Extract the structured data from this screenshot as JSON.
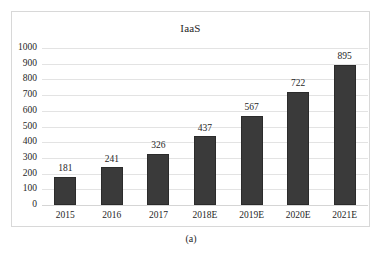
{
  "figure": {
    "caption": "(a)"
  },
  "chart_data": {
    "type": "bar",
    "title": "IaaS",
    "xlabel": "",
    "ylabel": "",
    "categories": [
      "2015",
      "2016",
      "2017",
      "2018E",
      "2019E",
      "2020E",
      "2021E"
    ],
    "values": [
      181,
      241,
      326,
      437,
      567,
      722,
      895
    ],
    "data_labels": [
      "181",
      "241",
      "326",
      "437",
      "567",
      "722",
      "895"
    ],
    "ylim": [
      0,
      1000
    ],
    "ytick_step": 100,
    "ytick_labels": [
      "1000",
      "900",
      "800",
      "700",
      "600",
      "500",
      "400",
      "300",
      "200",
      "100",
      "0"
    ],
    "ytick_values": [
      1000,
      900,
      800,
      700,
      600,
      500,
      400,
      300,
      200,
      100,
      0
    ],
    "grid": true,
    "legend": false,
    "legend_position": "none",
    "bar_color": "#3a3a3a",
    "bar_border_color": "#2b2b2b",
    "gridline_color": "#e3e3e3",
    "frame_color": "#d8d8d8",
    "background_color": "#ffffff"
  }
}
